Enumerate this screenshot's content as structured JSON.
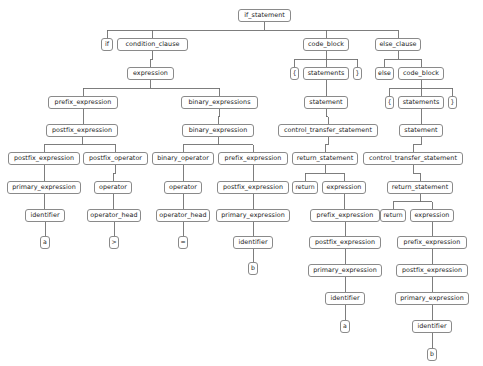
{
  "diagram": {
    "type": "syntax-tree",
    "node_border_color": "#8a8a8a",
    "node_fill_color": "#ffffff",
    "edge_color": "#6f6f6f",
    "background_color": "#ffffff",
    "text_color": "#1a1a1a"
  },
  "nodes": [
    {
      "id": "n0",
      "label": "if_statement",
      "x": 238,
      "y": 9,
      "w": 53,
      "leaf": false
    },
    {
      "id": "n1",
      "label": "if",
      "x": 101,
      "y": 38,
      "w": 12,
      "leaf": false
    },
    {
      "id": "n2",
      "label": "condition_clause",
      "x": 117,
      "y": 38,
      "w": 71,
      "leaf": false
    },
    {
      "id": "n3",
      "label": "code_block",
      "x": 303,
      "y": 38,
      "w": 46,
      "leaf": false
    },
    {
      "id": "n4",
      "label": "else_clause",
      "x": 375,
      "y": 38,
      "w": 46,
      "leaf": false
    },
    {
      "id": "n5",
      "label": "expression",
      "x": 127,
      "y": 67,
      "w": 47,
      "leaf": false
    },
    {
      "id": "n6",
      "label": "{",
      "x": 290,
      "y": 67,
      "w": 9,
      "leaf": true
    },
    {
      "id": "n7",
      "label": "statements",
      "x": 303,
      "y": 67,
      "w": 46,
      "leaf": false
    },
    {
      "id": "n8",
      "label": "}",
      "x": 353,
      "y": 67,
      "w": 9,
      "leaf": true
    },
    {
      "id": "n9",
      "label": "else",
      "x": 375,
      "y": 67,
      "w": 19,
      "leaf": true
    },
    {
      "id": "n10",
      "label": "code_block",
      "x": 398,
      "y": 67,
      "w": 46,
      "leaf": false
    },
    {
      "id": "n11",
      "label": "prefix_expression",
      "x": 48,
      "y": 96,
      "w": 70,
      "leaf": false
    },
    {
      "id": "n12",
      "label": "binary_expressions",
      "x": 181,
      "y": 96,
      "w": 77,
      "leaf": false
    },
    {
      "id": "n13",
      "label": "statement",
      "x": 304,
      "y": 96,
      "w": 44,
      "leaf": false
    },
    {
      "id": "n14",
      "label": "{",
      "x": 385,
      "y": 96,
      "w": 9,
      "leaf": true
    },
    {
      "id": "n15",
      "label": "statements",
      "x": 398,
      "y": 96,
      "w": 46,
      "leaf": false
    },
    {
      "id": "n16",
      "label": "}",
      "x": 448,
      "y": 96,
      "w": 9,
      "leaf": true
    },
    {
      "id": "n17",
      "label": "postfix_expression",
      "x": 46,
      "y": 124,
      "w": 72,
      "leaf": false
    },
    {
      "id": "n18",
      "label": "binary_expression",
      "x": 182,
      "y": 124,
      "w": 72,
      "leaf": false
    },
    {
      "id": "n19",
      "label": "control_transfer_statement",
      "x": 278,
      "y": 124,
      "w": 100,
      "leaf": false
    },
    {
      "id": "n20",
      "label": "statement",
      "x": 399,
      "y": 124,
      "w": 44,
      "leaf": false
    },
    {
      "id": "n21",
      "label": "postfix_expression",
      "x": 8,
      "y": 152,
      "w": 72,
      "leaf": false
    },
    {
      "id": "n22",
      "label": "postfix_operator",
      "x": 83,
      "y": 152,
      "w": 65,
      "leaf": false
    },
    {
      "id": "n23",
      "label": "binary_operator",
      "x": 152,
      "y": 152,
      "w": 62,
      "leaf": false
    },
    {
      "id": "n24",
      "label": "prefix_expression",
      "x": 218,
      "y": 152,
      "w": 70,
      "leaf": false
    },
    {
      "id": "n25",
      "label": "return_statement",
      "x": 292,
      "y": 152,
      "w": 66,
      "leaf": false
    },
    {
      "id": "n26",
      "label": "control_transfer_statement",
      "x": 363,
      "y": 152,
      "w": 100,
      "leaf": false
    },
    {
      "id": "n27",
      "label": "primary_expression",
      "x": 7,
      "y": 181,
      "w": 74,
      "leaf": false
    },
    {
      "id": "n28",
      "label": "operator",
      "x": 94,
      "y": 181,
      "w": 38,
      "leaf": false
    },
    {
      "id": "n29",
      "label": "operator",
      "x": 164,
      "y": 181,
      "w": 38,
      "leaf": false
    },
    {
      "id": "n30",
      "label": "postfix_expression",
      "x": 217,
      "y": 181,
      "w": 72,
      "leaf": false
    },
    {
      "id": "n31",
      "label": "return",
      "x": 292,
      "y": 181,
      "w": 26,
      "leaf": true
    },
    {
      "id": "n32",
      "label": "expression",
      "x": 322,
      "y": 181,
      "w": 44,
      "leaf": false
    },
    {
      "id": "n33",
      "label": "return_statement",
      "x": 387,
      "y": 181,
      "w": 66,
      "leaf": false
    },
    {
      "id": "n34",
      "label": "identifier",
      "x": 25,
      "y": 209,
      "w": 40,
      "leaf": false
    },
    {
      "id": "n35",
      "label": "operator_head",
      "x": 87,
      "y": 209,
      "w": 54,
      "leaf": false
    },
    {
      "id": "n36",
      "label": "operator_head",
      "x": 156,
      "y": 209,
      "w": 54,
      "leaf": false
    },
    {
      "id": "n37",
      "label": "primary_expression",
      "x": 216,
      "y": 209,
      "w": 74,
      "leaf": false
    },
    {
      "id": "n38",
      "label": "prefix_expression",
      "x": 310,
      "y": 209,
      "w": 70,
      "leaf": false
    },
    {
      "id": "n39",
      "label": "return",
      "x": 380,
      "y": 209,
      "w": 26,
      "leaf": true
    },
    {
      "id": "n40",
      "label": "expression",
      "x": 410,
      "y": 209,
      "w": 44,
      "leaf": false
    },
    {
      "id": "n41",
      "label": "a",
      "x": 40,
      "y": 236,
      "w": 10,
      "leaf": true
    },
    {
      "id": "n42",
      "label": ">",
      "x": 109,
      "y": 236,
      "w": 10,
      "leaf": true
    },
    {
      "id": "n43",
      "label": "=",
      "x": 178,
      "y": 236,
      "w": 10,
      "leaf": true
    },
    {
      "id": "n44",
      "label": "identifier",
      "x": 233,
      "y": 236,
      "w": 40,
      "leaf": false
    },
    {
      "id": "n45",
      "label": "postfix_expression",
      "x": 309,
      "y": 236,
      "w": 72,
      "leaf": false
    },
    {
      "id": "n46",
      "label": "prefix_expression",
      "x": 397,
      "y": 236,
      "w": 70,
      "leaf": false
    },
    {
      "id": "n47",
      "label": "b",
      "x": 248,
      "y": 262,
      "w": 10,
      "leaf": true
    },
    {
      "id": "n48",
      "label": "primary_expression",
      "x": 308,
      "y": 264,
      "w": 74,
      "leaf": false
    },
    {
      "id": "n49",
      "label": "postfix_expression",
      "x": 396,
      "y": 264,
      "w": 72,
      "leaf": false
    },
    {
      "id": "n50",
      "label": "identifier",
      "x": 325,
      "y": 292,
      "w": 40,
      "leaf": false
    },
    {
      "id": "n51",
      "label": "primary_expression",
      "x": 395,
      "y": 292,
      "w": 74,
      "leaf": false
    },
    {
      "id": "n52",
      "label": "a",
      "x": 340,
      "y": 320,
      "w": 10,
      "leaf": true
    },
    {
      "id": "n53",
      "label": "identifier",
      "x": 412,
      "y": 320,
      "w": 40,
      "leaf": false
    },
    {
      "id": "n54",
      "label": "b",
      "x": 427,
      "y": 348,
      "w": 10,
      "leaf": true
    }
  ],
  "edges": [
    [
      "n0",
      "n1"
    ],
    [
      "n0",
      "n2"
    ],
    [
      "n0",
      "n3"
    ],
    [
      "n0",
      "n4"
    ],
    [
      "n2",
      "n5"
    ],
    [
      "n3",
      "n6"
    ],
    [
      "n3",
      "n7"
    ],
    [
      "n3",
      "n8"
    ],
    [
      "n4",
      "n9"
    ],
    [
      "n4",
      "n10"
    ],
    [
      "n5",
      "n11"
    ],
    [
      "n5",
      "n12"
    ],
    [
      "n7",
      "n13"
    ],
    [
      "n10",
      "n14"
    ],
    [
      "n10",
      "n15"
    ],
    [
      "n10",
      "n16"
    ],
    [
      "n11",
      "n17"
    ],
    [
      "n12",
      "n18"
    ],
    [
      "n13",
      "n19"
    ],
    [
      "n15",
      "n20"
    ],
    [
      "n17",
      "n21"
    ],
    [
      "n17",
      "n22"
    ],
    [
      "n18",
      "n23"
    ],
    [
      "n18",
      "n24"
    ],
    [
      "n19",
      "n25"
    ],
    [
      "n20",
      "n26"
    ],
    [
      "n21",
      "n27"
    ],
    [
      "n22",
      "n28"
    ],
    [
      "n23",
      "n29"
    ],
    [
      "n24",
      "n30"
    ],
    [
      "n25",
      "n31"
    ],
    [
      "n25",
      "n32"
    ],
    [
      "n26",
      "n33"
    ],
    [
      "n27",
      "n34"
    ],
    [
      "n28",
      "n35"
    ],
    [
      "n29",
      "n36"
    ],
    [
      "n30",
      "n37"
    ],
    [
      "n32",
      "n38"
    ],
    [
      "n33",
      "n39"
    ],
    [
      "n33",
      "n40"
    ],
    [
      "n34",
      "n41"
    ],
    [
      "n35",
      "n42"
    ],
    [
      "n36",
      "n43"
    ],
    [
      "n37",
      "n44"
    ],
    [
      "n38",
      "n45"
    ],
    [
      "n40",
      "n46"
    ],
    [
      "n44",
      "n47"
    ],
    [
      "n45",
      "n48"
    ],
    [
      "n46",
      "n49"
    ],
    [
      "n48",
      "n50"
    ],
    [
      "n49",
      "n51"
    ],
    [
      "n50",
      "n52"
    ],
    [
      "n51",
      "n53"
    ],
    [
      "n53",
      "n54"
    ]
  ]
}
